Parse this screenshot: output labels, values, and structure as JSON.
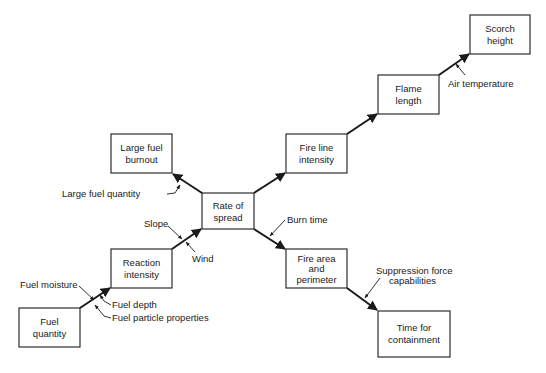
{
  "diagram": {
    "type": "flowchart",
    "nodes": [
      {
        "id": "fuel_quantity",
        "lines": [
          "Fuel",
          "quantity"
        ]
      },
      {
        "id": "reaction_intensity",
        "lines": [
          "Reaction",
          "intensity"
        ]
      },
      {
        "id": "large_fuel_burnout",
        "lines": [
          "Large fuel",
          "burnout"
        ]
      },
      {
        "id": "rate_of_spread",
        "lines": [
          "Rate of",
          "spread"
        ]
      },
      {
        "id": "fire_line_intensity",
        "lines": [
          "Fire line",
          "intensity"
        ]
      },
      {
        "id": "flame_length",
        "lines": [
          "Flame",
          "length"
        ]
      },
      {
        "id": "scorch_height",
        "lines": [
          "Scorch",
          "height"
        ]
      },
      {
        "id": "fire_area_perimeter",
        "lines": [
          "Fire area",
          "and",
          "perimeter"
        ]
      },
      {
        "id": "time_for_containment",
        "lines": [
          "Time for",
          "containment"
        ]
      }
    ],
    "edges": [
      {
        "from": "fuel_quantity",
        "to": "reaction_intensity"
      },
      {
        "from": "reaction_intensity",
        "to": "rate_of_spread"
      },
      {
        "from": "rate_of_spread",
        "to": "large_fuel_burnout"
      },
      {
        "from": "rate_of_spread",
        "to": "fire_line_intensity"
      },
      {
        "from": "fire_line_intensity",
        "to": "flame_length"
      },
      {
        "from": "flame_length",
        "to": "scorch_height"
      },
      {
        "from": "rate_of_spread",
        "to": "fire_area_perimeter"
      },
      {
        "from": "fire_area_perimeter",
        "to": "time_for_containment"
      }
    ],
    "modifiers": {
      "fuel_moisture": "Fuel moisture",
      "fuel_depth": "Fuel depth",
      "fuel_particle_properties": "Fuel particle properties",
      "slope": "Slope",
      "wind": "Wind",
      "large_fuel_quantity": "Large fuel quantity",
      "burn_time": "Burn time",
      "air_temperature": "Air temperature",
      "suppression_line1": "Suppression force",
      "suppression_line2": "capabilities"
    }
  }
}
